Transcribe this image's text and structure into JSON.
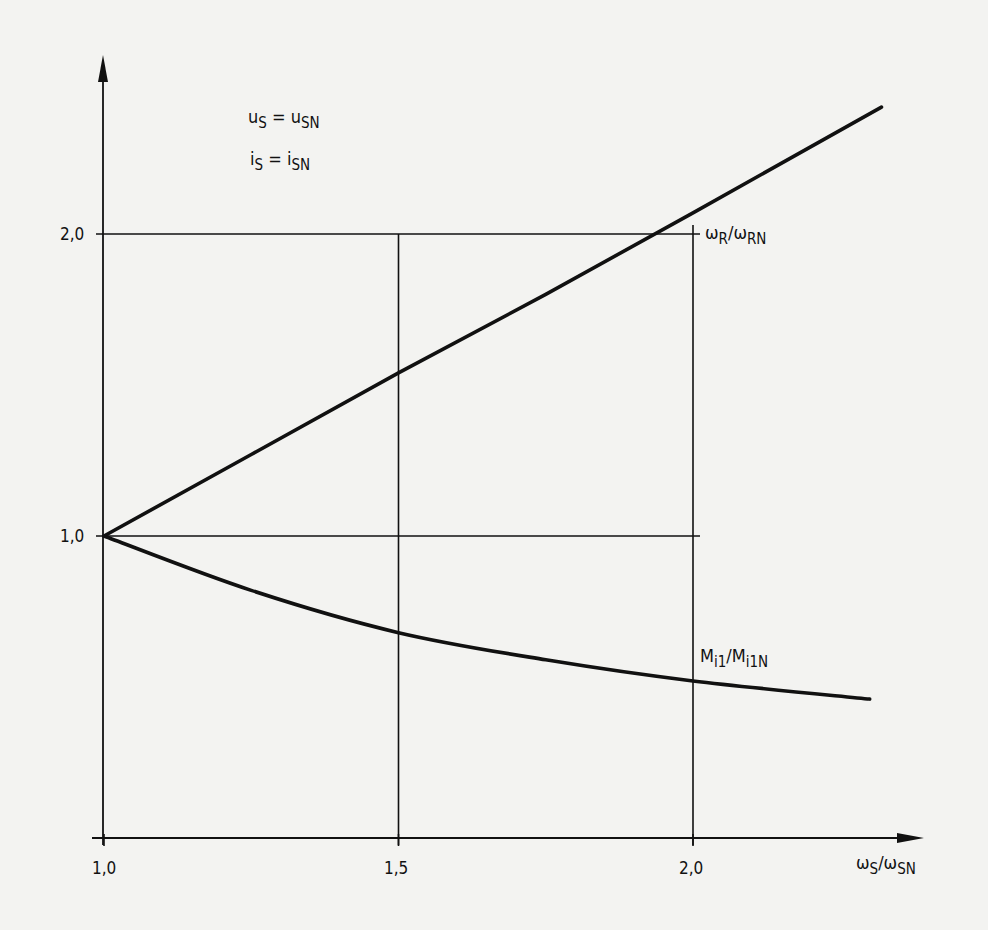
{
  "chart_data": {
    "type": "line",
    "title": "",
    "xlabel": "ωS/ωSN",
    "ylabel": "",
    "xlim": [
      1.0,
      2.35
    ],
    "ylim": [
      0.0,
      2.6
    ],
    "grid": true,
    "x_ticks": [
      "1,0",
      "1,5",
      "2,0"
    ],
    "y_ticks": [
      "1,0",
      "2,0"
    ],
    "conditions": [
      "uS = uSN",
      "iS = iSN"
    ],
    "series": [
      {
        "name": "ωR/ωRN",
        "x": [
          1.0,
          1.25,
          1.5,
          1.75,
          2.0,
          2.32
        ],
        "values": [
          1.0,
          1.27,
          1.54,
          1.8,
          2.07,
          2.42
        ]
      },
      {
        "name": "Mi1/Mi1N",
        "x": [
          1.0,
          1.25,
          1.5,
          1.75,
          2.0,
          2.3
        ],
        "values": [
          1.0,
          0.82,
          0.68,
          0.59,
          0.52,
          0.46
        ]
      }
    ]
  },
  "labels": {
    "y_tick_2": "2,0",
    "y_tick_1": "1,0",
    "x_tick_1": "1,0",
    "x_tick_15": "1,5",
    "x_tick_2": "2,0",
    "cond1_lhs": "u",
    "cond1_lhs_sub": "S",
    "cond1_eq": "=",
    "cond1_rhs": "u",
    "cond1_rhs_sub": "SN",
    "cond2_lhs": "i",
    "cond2_lhs_sub": "S",
    "cond2_eq": "=",
    "cond2_rhs": "i",
    "cond2_rhs_sub": "SN",
    "upper_num": "ω",
    "upper_num_sub": "R",
    "upper_den": "/ω",
    "upper_den_sub": "RN",
    "lower_num": "M",
    "lower_num_sub": "i1",
    "lower_den": "/M",
    "lower_den_sub": "i1N",
    "xaxis_num": "ω",
    "xaxis_num_sub": "S",
    "xaxis_den": "/ω",
    "xaxis_den_sub": "SN"
  }
}
